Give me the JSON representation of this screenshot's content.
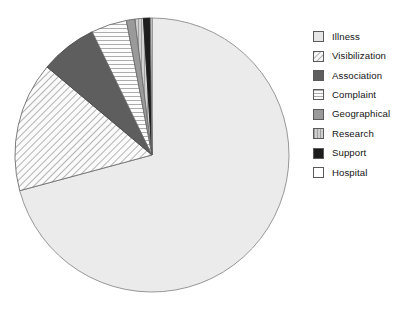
{
  "chart_data": {
    "type": "pie",
    "title": "",
    "subtitle": "",
    "xlabel": "",
    "ylabel": "",
    "grid": false,
    "legend_position": "right",
    "start_angle_deg": 0,
    "direction": "clockwise",
    "center": {
      "x": 152,
      "y": 155
    },
    "radius": 137,
    "labels": [
      "Illness",
      "Visibilization",
      "Association",
      "Complaint",
      "Geographical",
      "Research",
      "Support",
      "Hospital"
    ],
    "values": [
      70.8,
      15.3,
      6.7,
      4.2,
      1.0,
      1.0,
      0.8,
      0.2
    ],
    "angles_deg": [
      254.9,
      55.1,
      24.1,
      15.1,
      3.6,
      3.6,
      2.9,
      0.7
    ],
    "slices": [
      {
        "label": "Illness",
        "value": 70.8,
        "angle_deg": 254.9,
        "start_deg": 0,
        "end_deg": 254.9,
        "pattern": "solid",
        "fill": "#ebebeb",
        "stroke": "#8c8c8c"
      },
      {
        "label": "Visibilization",
        "value": 15.3,
        "angle_deg": 55.1,
        "start_deg": 254.9,
        "end_deg": 310.0,
        "pattern": "diagonal-hatch",
        "fill": "#f7f7f7",
        "stroke": "#6e6e6e"
      },
      {
        "label": "Association",
        "value": 6.7,
        "angle_deg": 24.1,
        "start_deg": 310.0,
        "end_deg": 334.1,
        "pattern": "solid",
        "fill": "#5e5e5e",
        "stroke": "#4a4a4a"
      },
      {
        "label": "Complaint",
        "value": 4.2,
        "angle_deg": 15.1,
        "start_deg": 334.1,
        "end_deg": 349.2,
        "pattern": "horizontal-lines",
        "fill": "#fafafa",
        "stroke": "#6e6e6e"
      },
      {
        "label": "Geographical",
        "value": 1.0,
        "angle_deg": 3.6,
        "start_deg": 349.2,
        "end_deg": 352.8,
        "pattern": "solid",
        "fill": "#9a9a9a",
        "stroke": "#6e6e6e"
      },
      {
        "label": "Research",
        "value": 1.0,
        "angle_deg": 3.6,
        "start_deg": 352.8,
        "end_deg": 356.4,
        "pattern": "vertical-lines",
        "fill": "#c8c8c8",
        "stroke": "#6e6e6e"
      },
      {
        "label": "Support",
        "value": 0.8,
        "angle_deg": 2.9,
        "start_deg": 356.4,
        "end_deg": 359.3,
        "pattern": "solid",
        "fill": "#1c1c1c",
        "stroke": "#1c1c1c"
      },
      {
        "label": "Hospital",
        "value": 0.2,
        "angle_deg": 0.7,
        "start_deg": 359.3,
        "end_deg": 360.0,
        "pattern": "none",
        "fill": "#ffffff",
        "stroke": "#6e6e6e"
      }
    ]
  },
  "legend": {
    "items": [
      {
        "label": "Illness",
        "pattern": "solid",
        "fill": "#e6e6e6"
      },
      {
        "label": "Visibilization",
        "pattern": "diagonal-hatch",
        "fill": "#f7f7f7"
      },
      {
        "label": "Association",
        "pattern": "solid",
        "fill": "#5e5e5e"
      },
      {
        "label": "Complaint",
        "pattern": "horizontal-lines",
        "fill": "#fafafa"
      },
      {
        "label": "Geographical",
        "pattern": "solid",
        "fill": "#9a9a9a"
      },
      {
        "label": "Research",
        "pattern": "vertical-lines",
        "fill": "#c8c8c8"
      },
      {
        "label": "Support",
        "pattern": "solid",
        "fill": "#1c1c1c"
      },
      {
        "label": "Hospital",
        "pattern": "none",
        "fill": "#ffffff"
      }
    ]
  },
  "colors": {
    "background": "#ffffff",
    "outline": "#8c8c8c",
    "text": "#141414"
  }
}
